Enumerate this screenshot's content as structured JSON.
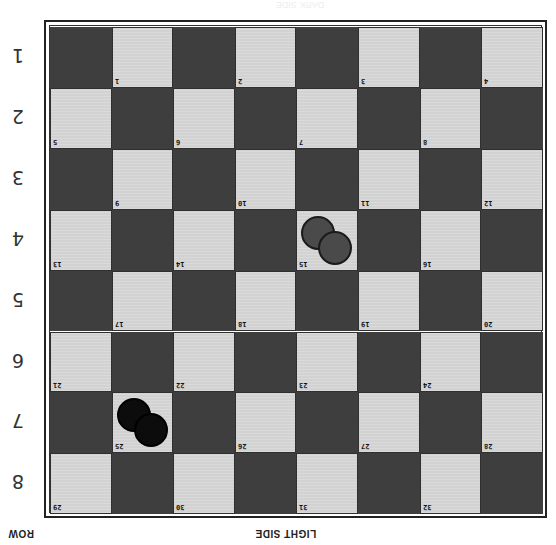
{
  "header": {
    "top_label": "DARK SIDE"
  },
  "footer": {
    "row_axis_label": "ROW",
    "side_label": "LIGHT SIDE"
  },
  "colors": {
    "dark_square": "#3e3e3e",
    "light_square": "#d2d2d2",
    "gray_piece": "#4a4a4a",
    "black_piece": "#0c0c0c"
  },
  "rows": [
    {
      "label": "1"
    },
    {
      "label": "2"
    },
    {
      "label": "3"
    },
    {
      "label": "4"
    },
    {
      "label": "5"
    },
    {
      "label": "6"
    },
    {
      "label": "7"
    },
    {
      "label": "8"
    }
  ],
  "squares": [
    "1",
    "2",
    "3",
    "4",
    "5",
    "6",
    "7",
    "8",
    "9",
    "10",
    "11",
    "12",
    "13",
    "14",
    "15",
    "16",
    "17",
    "18",
    "19",
    "20",
    "21",
    "22",
    "23",
    "24",
    "25",
    "26",
    "27",
    "28",
    "29",
    "30",
    "31",
    "32"
  ],
  "pieces": [
    {
      "square": "15",
      "color": "gray",
      "count": 2
    },
    {
      "square": "25",
      "color": "black",
      "count": 2
    }
  ]
}
